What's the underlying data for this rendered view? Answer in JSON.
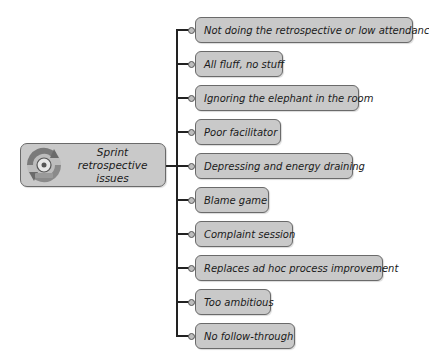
{
  "diagram": {
    "type": "mind-map",
    "center": {
      "label": "Sprint retrospective issues",
      "icon": "cycle-arrows-icon"
    },
    "branches": [
      {
        "label": "Not doing the retrospective or low attendance",
        "top": 17,
        "width": 218
      },
      {
        "label": "All fluff, no stuff",
        "top": 51,
        "width": 88
      },
      {
        "label": "Ignoring the elephant in the room",
        "top": 85,
        "width": 164
      },
      {
        "label": "Poor facilitator",
        "top": 119,
        "width": 86
      },
      {
        "label": "Depressing and energy draining",
        "top": 153,
        "width": 158
      },
      {
        "label": "Blame game",
        "top": 187,
        "width": 74
      },
      {
        "label": "Complaint session",
        "top": 221,
        "width": 98
      },
      {
        "label": "Replaces ad hoc process improvement",
        "top": 255,
        "width": 188
      },
      {
        "label": "Too ambitious",
        "top": 289,
        "width": 76
      },
      {
        "label": "No follow-through",
        "top": 323,
        "width": 100
      }
    ]
  },
  "colors": {
    "node_fill": "#c9c9c9",
    "node_border": "#6a6a6a",
    "connector": "#222222",
    "background": "#ffffff"
  }
}
